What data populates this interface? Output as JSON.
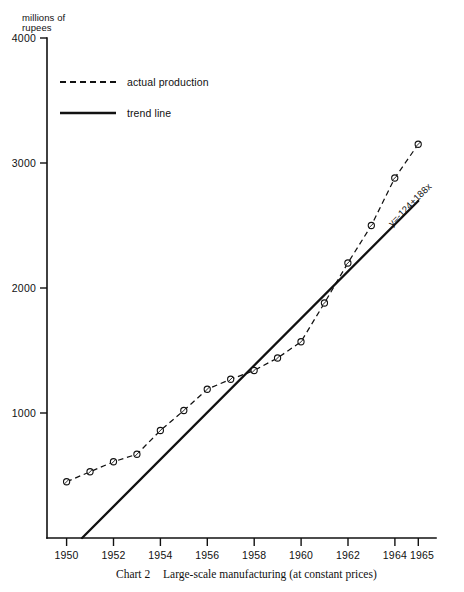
{
  "chart_data": {
    "type": "line",
    "title": "Large-scale manufacturing (at constant prices)",
    "caption_number": "Chart 2",
    "caption_text": "Large-scale manufacturing (at constant prices)",
    "ylabel": "millions of\nrupees",
    "ylabel_line1": "millions of",
    "ylabel_line2": "rupees",
    "xlabel": "",
    "x": [
      1950,
      1951,
      1952,
      1953,
      1954,
      1955,
      1956,
      1957,
      1958,
      1959,
      1960,
      1961,
      1962,
      1963,
      1964,
      1965
    ],
    "xlim": [
      1949.2,
      1965.4
    ],
    "ylim": [
      0,
      4000
    ],
    "yticks": [
      1000,
      2000,
      3000,
      4000
    ],
    "ytick_labels": [
      "1000",
      "2000",
      "3000",
      "4000"
    ],
    "xticks": [
      1950,
      1952,
      1954,
      1956,
      1958,
      1960,
      1962,
      1964,
      1965
    ],
    "xtick_labels": [
      "1950",
      "1952",
      "1954",
      "1956",
      "1958",
      "1960",
      "1962",
      "1964",
      "1965"
    ],
    "grid": false,
    "legend_position": "upper left",
    "series": [
      {
        "name": "actual production",
        "style": "dashed",
        "marker": "circle",
        "values": [
          450,
          530,
          610,
          670,
          860,
          1020,
          1190,
          1270,
          1340,
          1440,
          1570,
          1880,
          2200,
          2500,
          2880,
          3150
        ]
      },
      {
        "name": "trend line",
        "style": "solid",
        "marker": "none",
        "equation": "y=-124+188x",
        "intercept": -124,
        "slope": 188,
        "x_endpoints": [
          1950,
          1965
        ],
        "values": [
          -124,
          64,
          252,
          440,
          628,
          816,
          1004,
          1192,
          1380,
          1568,
          1756,
          1944,
          2132,
          2320,
          2508,
          2696
        ]
      }
    ],
    "annotations": [
      {
        "text": "y=-124+188x",
        "kind": "equation",
        "attached_to": "trend line"
      }
    ]
  },
  "legend": {
    "entries": [
      {
        "label": "actual production",
        "style": "dashed"
      },
      {
        "label": "trend line",
        "style": "solid"
      }
    ]
  }
}
